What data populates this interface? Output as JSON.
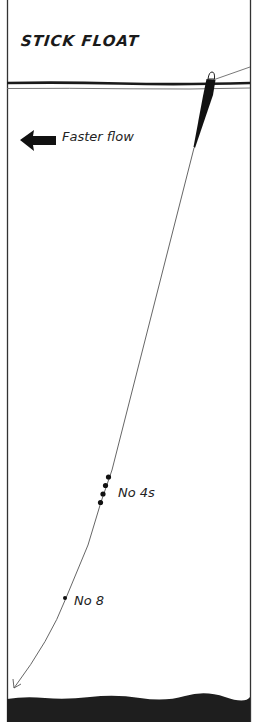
{
  "title": "STICK FLOAT",
  "flow": {
    "label": "Faster flow",
    "direction": "left"
  },
  "shots": [
    {
      "label": "No 4s",
      "count": 4
    },
    {
      "label": "No 8",
      "count": 1
    }
  ],
  "colors": {
    "ink": "#1a1a1a",
    "line": "#555555",
    "riverbed": "#1e1e1e",
    "background": "#ffffff"
  }
}
